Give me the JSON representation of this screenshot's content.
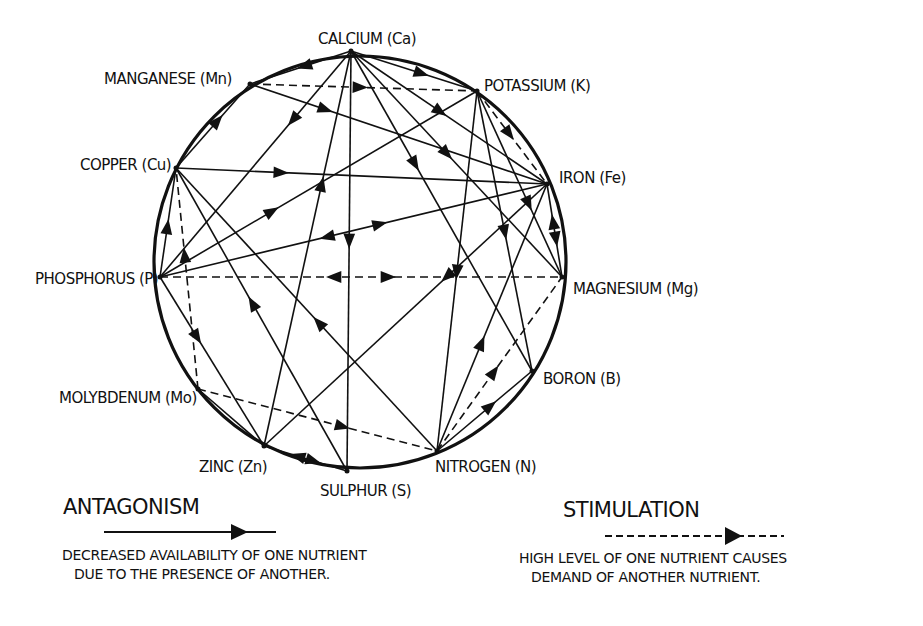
{
  "diagram": {
    "type": "nutrient-interaction-wheel",
    "circle": {
      "cx": 360,
      "cy": 262,
      "r": 206
    },
    "nodes": [
      {
        "id": "Ca",
        "label": "CALCIUM (Ca)",
        "x": 351,
        "y": 51,
        "lx": 318,
        "ly": 44
      },
      {
        "id": "Mn",
        "label": "MANGANESE (Mn)",
        "x": 250,
        "y": 84,
        "lx": 104,
        "ly": 84
      },
      {
        "id": "K",
        "label": "POTASSIUM (K)",
        "x": 477,
        "y": 91,
        "lx": 484,
        "ly": 91
      },
      {
        "id": "Cu",
        "label": "COPPER (Cu)",
        "x": 176,
        "y": 168,
        "lx": 80,
        "ly": 170
      },
      {
        "id": "Fe",
        "label": "IRON (Fe)",
        "x": 547,
        "y": 184,
        "lx": 559,
        "ly": 183
      },
      {
        "id": "P",
        "label": "PHOSPHORUS (P)",
        "x": 160,
        "y": 277,
        "lx": 35,
        "ly": 284
      },
      {
        "id": "Mg",
        "label": "MAGNESIUM (Mg)",
        "x": 562,
        "y": 277,
        "lx": 573,
        "ly": 294
      },
      {
        "id": "B",
        "label": "BORON (B)",
        "x": 532,
        "y": 371,
        "lx": 543,
        "ly": 384
      },
      {
        "id": "Mo",
        "label": "MOLYBDENUM (Mo)",
        "x": 198,
        "y": 389,
        "lx": 59,
        "ly": 403
      },
      {
        "id": "Zn",
        "label": "ZINC (Zn)",
        "x": 264,
        "y": 446,
        "lx": 199,
        "ly": 472
      },
      {
        "id": "S",
        "label": "SULPHUR (S)",
        "x": 347,
        "y": 471,
        "lx": 320,
        "ly": 496
      },
      {
        "id": "N",
        "label": "NITROGEN (N)",
        "x": 437,
        "y": 451,
        "lx": 435,
        "ly": 472
      }
    ],
    "edges": [
      {
        "from": "Ca",
        "to": "Mn",
        "type": "antagonism",
        "arrow_at": 0.45
      },
      {
        "from": "Ca",
        "to": "K",
        "type": "antagonism",
        "arrow_at": 0.55
      },
      {
        "from": "Mn",
        "to": "K",
        "type": "stimulation",
        "arrow_at": 0.48
      },
      {
        "from": "Mn",
        "to": "Fe",
        "type": "antagonism",
        "arrow_at": 0.25
      },
      {
        "from": "Cu",
        "to": "Mn",
        "type": "antagonism",
        "arrow_at": 0.55
      },
      {
        "from": "Ca",
        "to": "P",
        "type": "antagonism",
        "arrow_at": 0.3
      },
      {
        "from": "Ca",
        "to": "S",
        "type": "antagonism",
        "arrow_at": 0.45
      },
      {
        "from": "Ca",
        "to": "Fe",
        "type": "antagonism",
        "arrow_at": 0.45
      },
      {
        "from": "Ca",
        "to": "Mg",
        "type": "antagonism",
        "arrow_at": 0.45
      },
      {
        "from": "Ca",
        "to": "B",
        "type": "antagonism",
        "arrow_at": 0.35
      },
      {
        "from": "Zn",
        "to": "Ca",
        "type": "antagonism",
        "arrow_at": 0.66
      },
      {
        "from": "Cu",
        "to": "Fe",
        "type": "antagonism",
        "arrow_at": 0.28
      },
      {
        "from": "P",
        "to": "K",
        "type": "antagonism",
        "arrow_at": 0.35
      },
      {
        "from": "K",
        "to": "Fe",
        "type": "stimulation",
        "arrow_at": 0.45
      },
      {
        "from": "K",
        "to": "Mg",
        "type": "antagonism",
        "arrow_at": 0.6
      },
      {
        "from": "K",
        "to": "B",
        "type": "antagonism",
        "arrow_at": 0.5
      },
      {
        "from": "K",
        "to": "N",
        "type": "antagonism",
        "arrow_at": 0.5
      },
      {
        "from": "P",
        "to": "Fe",
        "type": "antagonism-mutual",
        "arrow_at": 0.5
      },
      {
        "from": "Fe",
        "to": "Mg",
        "type": "antagonism-mutual",
        "arrow_at": 0.5
      },
      {
        "from": "Fe",
        "to": "Zn",
        "type": "antagonism",
        "arrow_at": 0.35
      },
      {
        "from": "P",
        "to": "Mg",
        "type": "stimulation-mutual",
        "arrow_at": 0.5
      },
      {
        "from": "P",
        "to": "Cu",
        "type": "antagonism",
        "arrow_at": 0.45
      },
      {
        "from": "P",
        "to": "Zn",
        "type": "antagonism",
        "arrow_at": 0.35
      },
      {
        "from": "Mo",
        "to": "Cu",
        "type": "stimulation",
        "arrow_at": 0.6
      },
      {
        "from": "S",
        "to": "Cu",
        "type": "antagonism",
        "arrow_at": 0.55
      },
      {
        "from": "N",
        "to": "Cu",
        "type": "antagonism",
        "arrow_at": 0.45
      },
      {
        "from": "Mo",
        "to": "N",
        "type": "stimulation",
        "arrow_at": 0.6
      },
      {
        "from": "Zn",
        "to": "S",
        "type": "antagonism-mutual",
        "arrow_at": 0.5
      },
      {
        "from": "Mo",
        "to": "Zn",
        "type": "antagonism",
        "arrow_at": 0.0
      },
      {
        "from": "N",
        "to": "Fe",
        "type": "antagonism",
        "arrow_at": 0.4
      },
      {
        "from": "N",
        "to": "Mg",
        "type": "stimulation",
        "arrow_at": 0.45
      },
      {
        "from": "N",
        "to": "B",
        "type": "antagonism",
        "arrow_at": 0.55
      }
    ]
  },
  "legend": {
    "antagonism": {
      "title": "ANTAGONISM",
      "desc_line1": "Decreased availability of one nutrient",
      "desc_line2": "due to the presence of another."
    },
    "stimulation": {
      "title": "STIMULATION",
      "desc_line1": "High level of one nutrient causes",
      "desc_line2": "demand of another nutrient."
    }
  },
  "colors": {
    "ink": "#111111",
    "background": "#ffffff"
  }
}
